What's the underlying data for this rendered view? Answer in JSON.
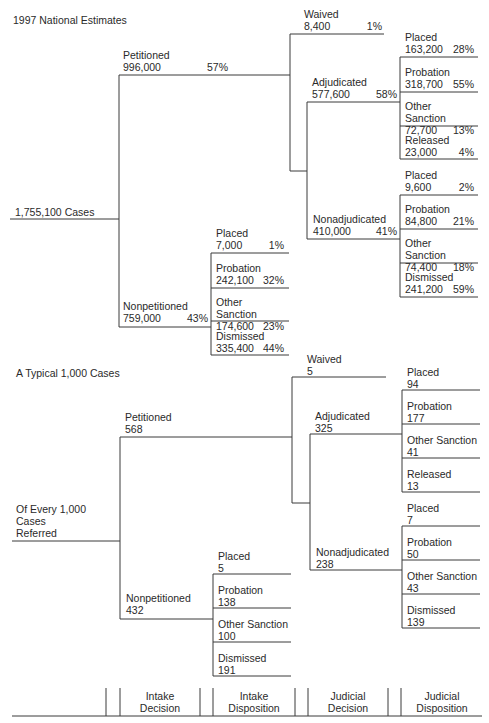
{
  "top_section": {
    "title": "1997 National Estimates",
    "root": "1,755,100 Cases",
    "petitioned": {
      "label": "Petitioned",
      "count": "996,000",
      "pct": "57%"
    },
    "nonpetitioned": {
      "label": "Nonpetitioned",
      "count": "759,000",
      "pct": "43%"
    },
    "waived": {
      "label": "Waived",
      "count": "8,400",
      "pct": "1%"
    },
    "adjudicated": {
      "label": "Adjudicated",
      "count": "577,600",
      "pct": "58%"
    },
    "nonadjudicated": {
      "label": "Nonadjudicated",
      "count": "410,000",
      "pct": "41%"
    },
    "adjudicated_dispositions": [
      {
        "label": "Placed",
        "count": "163,200",
        "pct": "28%"
      },
      {
        "label": "Probation",
        "count": "318,700",
        "pct": "55%"
      },
      {
        "label": "Other Sanction",
        "count": "72,700",
        "pct": "13%"
      },
      {
        "label": "Released",
        "count": "23,000",
        "pct": "4%"
      }
    ],
    "nonadjudicated_dispositions": [
      {
        "label": "Placed",
        "count": "9,600",
        "pct": "2%"
      },
      {
        "label": "Probation",
        "count": "84,800",
        "pct": "21%"
      },
      {
        "label": "Other Sanction",
        "count": "74,400",
        "pct": "18%"
      },
      {
        "label": "Dismissed",
        "count": "241,200",
        "pct": "59%"
      }
    ],
    "nonpetitioned_dispositions": [
      {
        "label": "Placed",
        "count": "7,000",
        "pct": "1%"
      },
      {
        "label": "Probation",
        "count": "242,100",
        "pct": "32%"
      },
      {
        "label": "Other Sanction",
        "count": "174,600",
        "pct": "23%"
      },
      {
        "label": "Dismissed",
        "count": "335,400",
        "pct": "44%"
      }
    ]
  },
  "bottom_section": {
    "title": "A Typical 1,000 Cases",
    "root_lines": [
      "Of Every 1,000",
      "Cases",
      "Referred"
    ],
    "petitioned": {
      "label": "Petitioned",
      "count": "568"
    },
    "nonpetitioned": {
      "label": "Nonpetitioned",
      "count": "432"
    },
    "waived": {
      "label": "Waived",
      "count": "5"
    },
    "adjudicated": {
      "label": "Adjudicated",
      "count": "325"
    },
    "nonadjudicated": {
      "label": "Nonadjudicated",
      "count": "238"
    },
    "adjudicated_dispositions": [
      {
        "label": "Placed",
        "count": "94"
      },
      {
        "label": "Probation",
        "count": "177"
      },
      {
        "label": "Other Sanction",
        "count": "41"
      },
      {
        "label": "Released",
        "count": "13"
      }
    ],
    "nonadjudicated_dispositions": [
      {
        "label": "Placed",
        "count": "7"
      },
      {
        "label": "Probation",
        "count": "50"
      },
      {
        "label": "Other Sanction",
        "count": "43"
      },
      {
        "label": "Dismissed",
        "count": "139"
      }
    ],
    "nonpetitioned_dispositions": [
      {
        "label": "Placed",
        "count": "5"
      },
      {
        "label": "Probation",
        "count": "138"
      },
      {
        "label": "Other Sanction",
        "count": "100"
      },
      {
        "label": "Dismissed",
        "count": "191"
      }
    ]
  },
  "stage_headers": [
    {
      "line1": "Intake",
      "line2": "Decision"
    },
    {
      "line1": "Intake",
      "line2": "Disposition"
    },
    {
      "line1": "Judicial",
      "line2": "Decision"
    },
    {
      "line1": "Judicial",
      "line2": "Disposition"
    }
  ]
}
